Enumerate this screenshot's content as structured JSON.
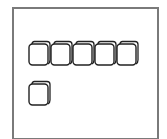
{
  "diagram": {
    "type": "unit-cubes",
    "frame_color": "#7a7a7a",
    "stroke_color": "#222222",
    "groups": [
      {
        "name": "row",
        "count": 5,
        "label": "5"
      },
      {
        "name": "single",
        "count": 1,
        "label": "1"
      }
    ],
    "total_label": "6"
  }
}
